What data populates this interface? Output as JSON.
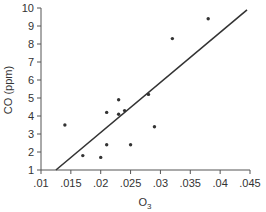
{
  "chart_data": {
    "type": "scatter",
    "title": "",
    "xlabel": "O",
    "xlabel_subscript": "3",
    "ylabel": "CO (ppm)",
    "xlim": [
      0.01,
      0.045
    ],
    "ylim": [
      1,
      10
    ],
    "x_ticks": [
      0.01,
      0.015,
      0.02,
      0.025,
      0.03,
      0.035,
      0.04,
      0.045
    ],
    "x_tick_labels": [
      ".01",
      ".015",
      ".02",
      ".025",
      ".03",
      ".035",
      ".04",
      ".045"
    ],
    "y_ticks": [
      1,
      2,
      3,
      4,
      5,
      6,
      7,
      8,
      9,
      10
    ],
    "y_tick_labels": [
      "1",
      "2",
      "3",
      "4",
      "5",
      "6",
      "7",
      "8",
      "9",
      "10"
    ],
    "grid": false,
    "legend": null,
    "series": [
      {
        "name": "observations",
        "points": [
          {
            "x": 0.014,
            "y": 3.5
          },
          {
            "x": 0.017,
            "y": 1.8
          },
          {
            "x": 0.02,
            "y": 1.7
          },
          {
            "x": 0.021,
            "y": 2.4
          },
          {
            "x": 0.021,
            "y": 4.2
          },
          {
            "x": 0.023,
            "y": 4.9
          },
          {
            "x": 0.023,
            "y": 4.1
          },
          {
            "x": 0.024,
            "y": 4.3
          },
          {
            "x": 0.025,
            "y": 2.4
          },
          {
            "x": 0.028,
            "y": 5.2
          },
          {
            "x": 0.029,
            "y": 3.4
          },
          {
            "x": 0.032,
            "y": 8.3
          },
          {
            "x": 0.038,
            "y": 9.4
          }
        ]
      }
    ],
    "fit_line": {
      "x1": 0.0125,
      "y1": 1.0,
      "x2": 0.0445,
      "y2": 9.9
    },
    "colors": {
      "axis": "#555555",
      "point": "#333333",
      "line": "#333333"
    }
  }
}
